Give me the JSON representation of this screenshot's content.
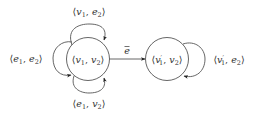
{
  "diagram": {
    "type": "state-graph",
    "nodes": [
      {
        "id": "n1",
        "label": "⟨v₁, v₂⟩",
        "parts": {
          "open": "⟨",
          "a": "v",
          "a_sub": "1",
          "sep": ", ",
          "b": "v",
          "b_sub": "2",
          "close": "⟩"
        }
      },
      {
        "id": "n2",
        "label": "⟨v′₁, v₂⟩",
        "parts": {
          "open": "⟨",
          "a": "v",
          "a_prime": "′",
          "a_sub": "1",
          "sep": ", ",
          "b": "v",
          "b_sub": "2",
          "close": "⟩"
        }
      }
    ],
    "edges": [
      {
        "id": "loop-top",
        "from": "n1",
        "to": "n1",
        "label": "⟨v₁, e₂⟩",
        "parts": {
          "open": "⟨",
          "a": "v",
          "a_sub": "1",
          "sep": ", ",
          "b": "e",
          "b_sub": "2",
          "close": "⟩"
        }
      },
      {
        "id": "loop-left",
        "from": "n1",
        "to": "n1",
        "label": "⟨e₁, e₂⟩",
        "parts": {
          "open": "⟨",
          "a": "e",
          "a_sub": "1",
          "sep": ", ",
          "b": "e",
          "b_sub": "2",
          "close": "⟩"
        }
      },
      {
        "id": "loop-bottom",
        "from": "n1",
        "to": "n1",
        "label": "⟨e₁, v₂⟩",
        "parts": {
          "open": "⟨",
          "a": "e",
          "a_sub": "1",
          "sep": ", ",
          "b": "v",
          "b_sub": "2",
          "close": "⟩"
        }
      },
      {
        "id": "edge-main",
        "from": "n1",
        "to": "n2",
        "label": "ē",
        "parts": {
          "base": "e",
          "bar": "¯"
        }
      },
      {
        "id": "loop-right",
        "from": "n2",
        "to": "n2",
        "label": "⟨v′₁, e₂⟩",
        "parts": {
          "open": "⟨",
          "a": "v",
          "a_prime": "′",
          "a_sub": "1",
          "sep": ", ",
          "b": "e",
          "b_sub": "2",
          "close": "⟩"
        }
      }
    ]
  }
}
